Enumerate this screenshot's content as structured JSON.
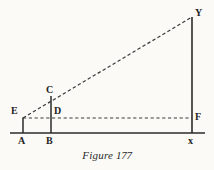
{
  "figure": {
    "caption_prefix": "Figure",
    "caption_number": "177",
    "ink_color": "#2b2b2b",
    "background_color": "#fbfaf6",
    "labels": {
      "A": "A",
      "B": "B",
      "C": "C",
      "D": "D",
      "E": "E",
      "F": "F",
      "X": "x",
      "Y": "Y"
    },
    "points": {
      "A": [
        23,
        133
      ],
      "B": [
        51,
        133
      ],
      "C": [
        51,
        96
      ],
      "D": [
        51,
        118
      ],
      "E": [
        23,
        118
      ],
      "F": [
        192,
        118
      ],
      "X": [
        192,
        133
      ],
      "Y": [
        192,
        17
      ]
    },
    "segments": [
      {
        "name": "baseline-AX",
        "style": "solid",
        "from": [
          10,
          133
        ],
        "to": [
          205,
          133
        ]
      },
      {
        "name": "vertical-AE",
        "style": "solid",
        "from": [
          23,
          118
        ],
        "to": [
          23,
          133
        ]
      },
      {
        "name": "vertical-BC",
        "style": "solid",
        "from": [
          51,
          96
        ],
        "to": [
          51,
          133
        ]
      },
      {
        "name": "vertical-XY",
        "style": "solid",
        "from": [
          192,
          17
        ],
        "to": [
          192,
          133
        ]
      },
      {
        "name": "dashed-EF",
        "style": "dashed",
        "from": [
          23,
          118
        ],
        "to": [
          192,
          118
        ]
      },
      {
        "name": "dashed-EY",
        "style": "dashed",
        "from": [
          23,
          118
        ],
        "to": [
          192,
          17
        ]
      }
    ]
  }
}
